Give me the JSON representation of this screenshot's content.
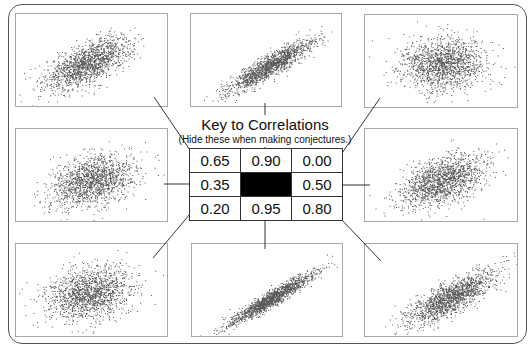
{
  "key": {
    "title": "Key to Correlations",
    "subtitle": "(Hide these when making conjectures.)",
    "rows": [
      [
        "0.65",
        "0.90",
        "0.00"
      ],
      [
        "0.35",
        "",
        "0.50"
      ],
      [
        "0.20",
        "0.95",
        "0.80"
      ]
    ],
    "center_color": "#000000"
  },
  "panels": [
    {
      "id": "top-left",
      "row": 0,
      "col": 0,
      "r": 0.65,
      "x": 15,
      "y": 13,
      "w": 153,
      "h": 94,
      "cx": 0.47,
      "cy": 0.52
    },
    {
      "id": "top-center",
      "row": 0,
      "col": 1,
      "r": 0.9,
      "x": 190,
      "y": 13,
      "w": 152,
      "h": 94,
      "cx": 0.52,
      "cy": 0.55
    },
    {
      "id": "top-right",
      "row": 0,
      "col": 2,
      "r": 0.0,
      "x": 364,
      "y": 14,
      "w": 154,
      "h": 94,
      "cx": 0.5,
      "cy": 0.52
    },
    {
      "id": "middle-left",
      "row": 1,
      "col": 0,
      "r": 0.35,
      "x": 15,
      "y": 128,
      "w": 153,
      "h": 94,
      "cx": 0.5,
      "cy": 0.55
    },
    {
      "id": "middle-right",
      "row": 1,
      "col": 2,
      "r": 0.5,
      "x": 364,
      "y": 128,
      "w": 154,
      "h": 94,
      "cx": 0.5,
      "cy": 0.55
    },
    {
      "id": "bottom-left",
      "row": 2,
      "col": 0,
      "r": 0.2,
      "x": 15,
      "y": 243,
      "w": 153,
      "h": 94,
      "cx": 0.48,
      "cy": 0.52
    },
    {
      "id": "bottom-center",
      "row": 2,
      "col": 1,
      "r": 0.95,
      "x": 191,
      "y": 243,
      "w": 152,
      "h": 94,
      "cx": 0.52,
      "cy": 0.58
    },
    {
      "id": "bottom-right",
      "row": 2,
      "col": 2,
      "r": 0.8,
      "x": 364,
      "y": 243,
      "w": 154,
      "h": 94,
      "cx": 0.55,
      "cy": 0.58
    }
  ],
  "connectors": [
    {
      "id": "top-left-connector",
      "x1": 154,
      "y1": 97,
      "x2": 196,
      "y2": 159
    },
    {
      "id": "top-center-connector",
      "x1": 265,
      "y1": 103,
      "x2": 265,
      "y2": 115
    },
    {
      "id": "top-center-connector-b",
      "x1": 265,
      "y1": 147,
      "x2": 265,
      "y2": 156
    },
    {
      "id": "top-right-connector",
      "x1": 380,
      "y1": 98,
      "x2": 340,
      "y2": 156
    },
    {
      "id": "middle-left-connector",
      "x1": 164,
      "y1": 184,
      "x2": 189,
      "y2": 184
    },
    {
      "id": "middle-right-connector",
      "x1": 342,
      "y1": 185,
      "x2": 370,
      "y2": 185
    },
    {
      "id": "bottom-left-connector",
      "x1": 190,
      "y1": 214,
      "x2": 153,
      "y2": 258
    },
    {
      "id": "bottom-center-connector",
      "x1": 265,
      "y1": 220,
      "x2": 265,
      "y2": 249
    },
    {
      "id": "bottom-right-connector",
      "x1": 340,
      "y1": 218,
      "x2": 381,
      "y2": 261
    }
  ],
  "points_per_panel": 1500,
  "dot_color": "#222222",
  "line_color": "#333333"
}
